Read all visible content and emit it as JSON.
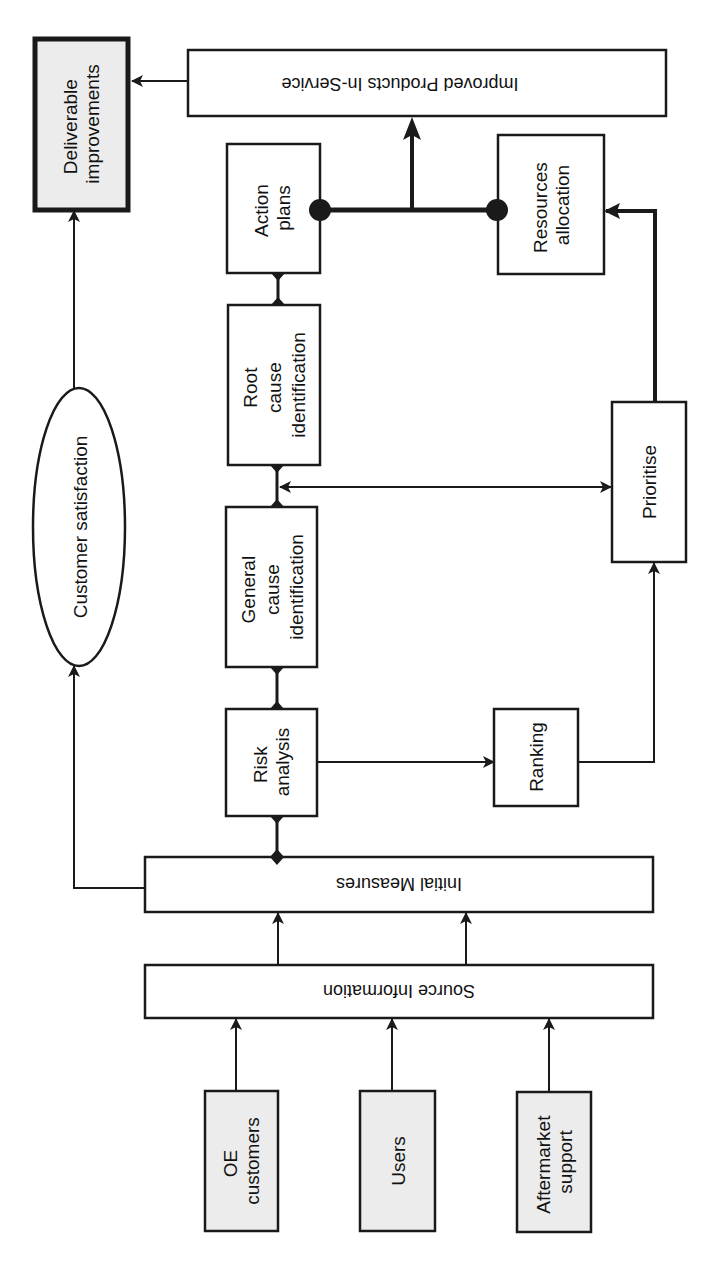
{
  "diagram": {
    "colors": {
      "stroke": "#1a1a1a",
      "background": "#ffffff",
      "source_fill": "#ececec",
      "deliverable_fill": "#ececec"
    },
    "sources": [
      {
        "line1": "OE",
        "line2": "customers"
      },
      {
        "line1": "Users",
        "line2": ""
      },
      {
        "line1": "Aftermarket",
        "line2": "support"
      }
    ],
    "source_information": "Source Information",
    "initial_measures": "Initial  Measures",
    "customer_satisfaction": "Customer satisfaction",
    "risk_analysis": {
      "line1": "Risk",
      "line2": "analysis"
    },
    "general_cause": {
      "line1": "General",
      "line2": "cause",
      "line3": "identification"
    },
    "root_cause": {
      "line1": "Root",
      "line2": "cause",
      "line3": "identification"
    },
    "action_plans": {
      "line1": "Action",
      "line2": "plans"
    },
    "ranking": "Ranking",
    "prioritise": "Prioritise",
    "resources_allocation": {
      "line1": "Resources",
      "line2": "allocation"
    },
    "improved_products": "Improved  Products In-Service",
    "deliverable": {
      "line1": "Deliverable",
      "line2": "improvements"
    }
  }
}
